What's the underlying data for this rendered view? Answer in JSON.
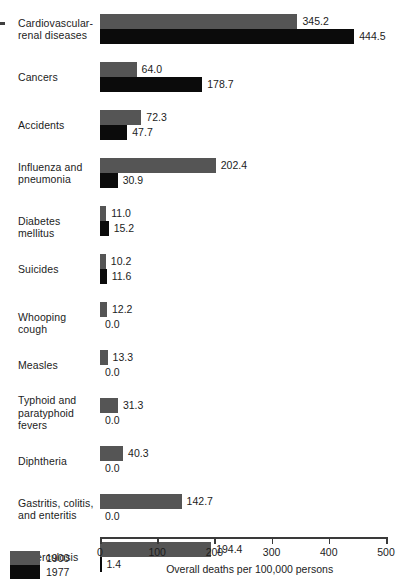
{
  "chart_data": {
    "type": "bar",
    "orientation": "horizontal",
    "title": "",
    "xlabel": "Overall deaths per 100,000 persons",
    "ylabel": "",
    "xlim": [
      0,
      500
    ],
    "xticks": [
      0,
      100,
      200,
      300,
      400,
      500
    ],
    "xtick_labels": [
      "0",
      "100",
      "200",
      "300",
      "400",
      "500"
    ],
    "grid": false,
    "legend_position": "bottom-left",
    "categories": [
      "Cardiovascular-renal diseases",
      "Cancers",
      "Accidents",
      "Influenza and pneumonia",
      "Diabetes mellitus",
      "Suicides",
      "Whooping cough",
      "Measles",
      "Typhoid and paratyphoid fevers",
      "Diphtheria",
      "Gastritis, colitis, and enteritis",
      "Tuberculosis"
    ],
    "series": [
      {
        "name": "1900",
        "color": "#555555",
        "values": [
          345.2,
          64.0,
          72.3,
          202.4,
          11.0,
          10.2,
          12.2,
          13.3,
          31.3,
          40.3,
          142.7,
          194.4
        ]
      },
      {
        "name": "1977",
        "color": "#0b0b0b",
        "values": [
          444.5,
          178.7,
          47.7,
          30.9,
          15.2,
          11.6,
          0.0,
          0.0,
          0.0,
          0.0,
          0.0,
          1.4
        ]
      }
    ],
    "value_label_format": "one-decimal"
  },
  "rows": [
    {
      "label_lines": [
        "Cardiovascular-",
        "renal diseases"
      ],
      "v1900": "345.2",
      "v1977": "444.5"
    },
    {
      "label_lines": [
        "Cancers"
      ],
      "v1900": "64.0",
      "v1977": "178.7"
    },
    {
      "label_lines": [
        "Accidents"
      ],
      "v1900": "72.3",
      "v1977": "47.7"
    },
    {
      "label_lines": [
        "Influenza and",
        "pneumonia"
      ],
      "v1900": "202.4",
      "v1977": "30.9"
    },
    {
      "label_lines": [
        "Diabetes mellitus"
      ],
      "v1900": "11.0",
      "v1977": "15.2"
    },
    {
      "label_lines": [
        "Suicides"
      ],
      "v1900": "10.2",
      "v1977": "11.6"
    },
    {
      "label_lines": [
        "Whooping cough"
      ],
      "v1900": "12.2",
      "v1977": "0.0"
    },
    {
      "label_lines": [
        "Measles"
      ],
      "v1900": "13.3",
      "v1977": "0.0"
    },
    {
      "label_lines": [
        "Typhoid and",
        "paratyphoid",
        "fevers"
      ],
      "v1900": "31.3",
      "v1977": "0.0"
    },
    {
      "label_lines": [
        "Diphtheria"
      ],
      "v1900": "40.3",
      "v1977": "0.0"
    },
    {
      "label_lines": [
        "Gastritis, colitis,",
        "and enteritis"
      ],
      "v1900": "142.7",
      "v1977": "0.0"
    },
    {
      "label_lines": [
        "Tuberculosis"
      ],
      "v1900": "194.4",
      "v1977": "1.4"
    }
  ],
  "axis": {
    "title": "Overall deaths per 100,000 persons",
    "ticks": [
      "0",
      "100",
      "200",
      "300",
      "400",
      "500"
    ]
  },
  "legend": {
    "series_1_label": "1900",
    "series_2_label": "1977",
    "color_1900": "#555555",
    "color_1977": "#0b0b0b"
  }
}
